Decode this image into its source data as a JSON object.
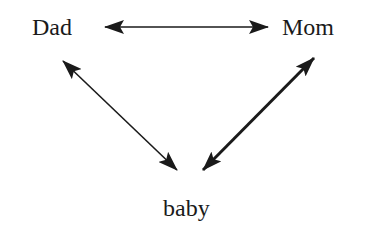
{
  "diagram": {
    "nodes": [
      {
        "id": "dad",
        "label": "Dad"
      },
      {
        "id": "mom",
        "label": "Mom"
      },
      {
        "id": "baby",
        "label": "baby"
      }
    ],
    "edges": [
      {
        "from": "dad",
        "to": "mom",
        "direction": "bidirectional",
        "weight": "thin"
      },
      {
        "from": "dad",
        "to": "baby",
        "direction": "bidirectional",
        "weight": "thin"
      },
      {
        "from": "mom",
        "to": "baby",
        "direction": "bidirectional",
        "weight": "thick"
      }
    ],
    "colors": {
      "ink": "#1a1a1a",
      "background": "#ffffff"
    }
  }
}
